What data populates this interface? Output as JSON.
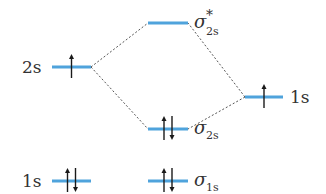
{
  "diagram": {
    "type": "molecular-orbital-diagram",
    "colors": {
      "level": "#4fa3dc",
      "correlation_line": "#555555",
      "electron_arrow": "#1a1a1a",
      "text": "#333333"
    },
    "left_atom": {
      "levels": [
        {
          "id": "left-2s",
          "label": "2s",
          "electrons": [
            "up"
          ]
        },
        {
          "id": "left-1s",
          "label": "1s",
          "electrons": [
            "up",
            "down"
          ]
        }
      ]
    },
    "right_atom": {
      "levels": [
        {
          "id": "right-1s",
          "label": "1s",
          "electrons": [
            "up"
          ]
        }
      ]
    },
    "molecule": {
      "levels": [
        {
          "id": "sigma-star-2s",
          "symbol": "σ",
          "superscript": "*",
          "subscript": "2s",
          "electrons": []
        },
        {
          "id": "sigma-2s",
          "symbol": "σ",
          "superscript": "",
          "subscript": "2s",
          "electrons": [
            "up",
            "down"
          ]
        },
        {
          "id": "sigma-1s",
          "symbol": "σ",
          "superscript": "",
          "subscript": "1s",
          "electrons": [
            "up",
            "down"
          ]
        }
      ]
    },
    "correlations": [
      {
        "from": "left-2s",
        "to": "sigma-star-2s"
      },
      {
        "from": "left-2s",
        "to": "sigma-2s"
      },
      {
        "from": "right-1s",
        "to": "sigma-star-2s"
      },
      {
        "from": "right-1s",
        "to": "sigma-2s"
      }
    ]
  }
}
